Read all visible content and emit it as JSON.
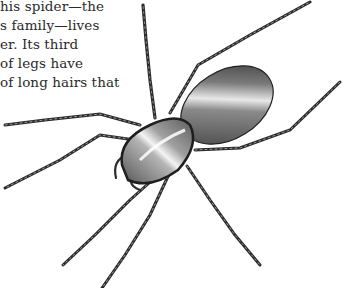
{
  "page": {
    "text_lines": [
      "This spider—the",
      "its family—lives",
      "water. Its third",
      "pairs of legs have",
      "rows of long hairs that"
    ],
    "visible_fragments": [
      "his spider—the",
      "s family—lives",
      "er. Its third",
      "of legs have",
      "of long hairs that"
    ]
  },
  "illustration": {
    "subject": "spider-illustration",
    "style": "engraved pen-and-ink",
    "colors": {
      "ink": "#1e1e1e",
      "mid": "#6b6b6b",
      "light": "#bdbdbd",
      "paper": "#ffffff"
    }
  }
}
